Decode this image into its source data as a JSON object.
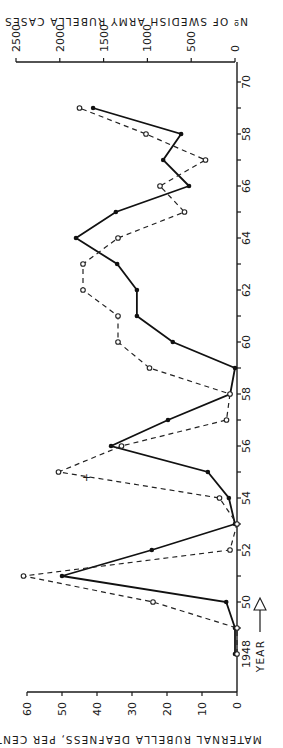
{
  "chart_data": {
    "type": "line",
    "orientation": "rotated-90-clockwise",
    "x": [
      1948,
      1949,
      1950,
      1951,
      1952,
      1953,
      1954,
      1955,
      1956,
      1957,
      1958,
      1959,
      1960,
      1961,
      1962,
      1963,
      1964,
      1965,
      1966,
      1967,
      1968,
      1969
    ],
    "series": [
      {
        "name": "Maternal rubella deafness, per cent",
        "style": "dashed, open circles",
        "axis": "bottom",
        "values": [
          0,
          0,
          24,
          61,
          2,
          0,
          5,
          51,
          33,
          3,
          2,
          25,
          34,
          34,
          44,
          44,
          34,
          15,
          22,
          9,
          26,
          45
        ]
      },
      {
        "name": "No of Swedish army rubella cases",
        "style": "solid, filled dots",
        "axis": "top",
        "values": [
          0,
          0,
          100,
          1975,
          950,
          0,
          70,
          310,
          1415,
          765,
          55,
          0,
          710,
          1120,
          1120,
          1345,
          1815,
          1360,
          525,
          820,
          615,
          1620
        ]
      }
    ],
    "year_axis": {
      "label": "YEAR",
      "first_label": "1948",
      "tick_labels": [
        "50",
        "52",
        "54",
        "56",
        "58",
        "60",
        "62",
        "64",
        "66",
        "58",
        "70"
      ],
      "tick_years": [
        1950,
        1952,
        1954,
        1956,
        1958,
        1960,
        1962,
        1964,
        1966,
        1968,
        1970
      ],
      "range": [
        1948,
        1970
      ]
    },
    "bottom_axis": {
      "title": "MATERNAL RUBELLA DEAFNESS, PER CENT",
      "tick_labels": [
        "0",
        "10",
        "20",
        "30",
        "40",
        "50",
        "60"
      ],
      "range": [
        0,
        60
      ]
    },
    "top_axis": {
      "title": "Nº OF SWEDISH ARMY RUBELLA CASES",
      "tick_labels": [
        "0",
        "500",
        "1000",
        "1500",
        "2000",
        "2500"
      ],
      "range": [
        0,
        2500
      ]
    },
    "annotations": [
      {
        "text": "+",
        "year": 1954.8,
        "value_pct": 43
      }
    ],
    "grid": false,
    "legend": "none"
  },
  "colors": {
    "ink": "#1a1a1a",
    "background": "#ffffff"
  }
}
